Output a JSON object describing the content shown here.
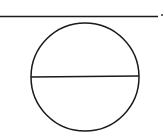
{
  "diagram": {
    "canvas": {
      "width": 164,
      "height": 139,
      "background": "#ffffff"
    },
    "stroke_color": "#1a1a1a",
    "top_line": {
      "x1": 0,
      "y1": 16.5,
      "x2": 158,
      "y2": 16.5,
      "stroke_width": 1.5
    },
    "end_dot": {
      "cx": 162,
      "cy": 15,
      "r": 0.9
    },
    "circle": {
      "cx": 85,
      "cy": 77,
      "r": 54,
      "stroke_width": 1.5
    },
    "diameter": {
      "x1": 31,
      "y1": 77,
      "x2": 139,
      "y2": 76,
      "stroke_width": 1.5
    }
  }
}
